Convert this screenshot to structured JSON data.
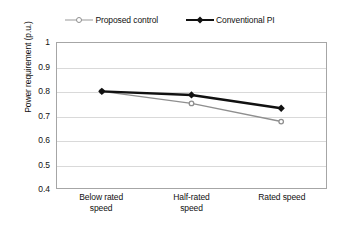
{
  "chart_data": {
    "type": "line",
    "title": "",
    "xlabel": "",
    "ylabel": "Power requirement (p.u.)",
    "categories": [
      "Below rated speed",
      "Half-rated speed",
      "Rated speed"
    ],
    "category_lines": [
      [
        "Below rated",
        "speed"
      ],
      [
        "Half-rated",
        "speed"
      ],
      [
        "Rated speed"
      ]
    ],
    "series": [
      {
        "name": "Proposed control",
        "color": "#8f8f8f",
        "marker": "circle-open",
        "values": [
          0.8,
          0.75,
          0.675
        ]
      },
      {
        "name": "Conventional PI",
        "color": "#111111",
        "marker": "diamond-filled",
        "values": [
          0.8,
          0.785,
          0.73
        ]
      }
    ],
    "ylim": [
      0.4,
      1.0
    ],
    "yticks": [
      "0.4",
      "0.5",
      "0.6",
      "0.7",
      "0.8",
      "0.9",
      "1"
    ],
    "ytick_values": [
      0.4,
      0.5,
      0.6,
      0.7,
      0.8,
      0.9,
      1.0
    ],
    "grid": "horizontal",
    "legend_position": "top"
  },
  "legend": {
    "entries": [
      {
        "label": "Proposed control"
      },
      {
        "label": "Conventional PI"
      }
    ]
  }
}
